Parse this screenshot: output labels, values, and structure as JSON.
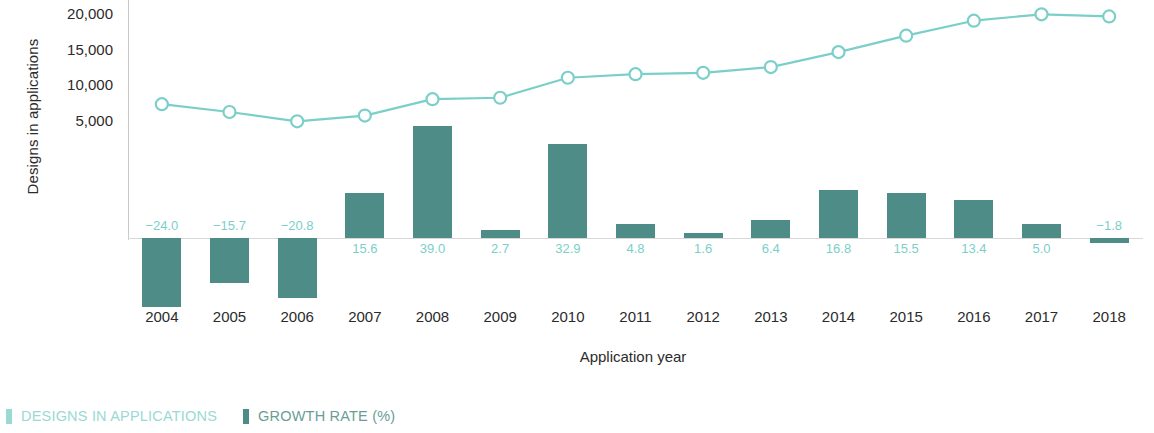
{
  "axes": {
    "y_title": "Designs in applications",
    "x_title": "Application year",
    "y_ticks": [
      "20,000",
      "15,000",
      "10,000",
      "5,000"
    ]
  },
  "legend": {
    "items": [
      {
        "label": "DESIGNS IN APPLICATIONS",
        "color": "#9ad9d4",
        "tone": "light"
      },
      {
        "label": "GROWTH RATE (%)",
        "color": "#4e8d87",
        "tone": "dark"
      }
    ]
  },
  "colors": {
    "bar": "#4e8d87",
    "line": "#7bcfc9",
    "bar_label": "#7bcfc9",
    "axis": "#c9c9c9",
    "text": "#2b2b2b",
    "background": "#ffffff"
  },
  "chart_data": {
    "type": "bar",
    "title": "",
    "xlabel": "Application year",
    "ylabel": "Designs in applications",
    "categories": [
      "2004",
      "2005",
      "2006",
      "2007",
      "2008",
      "2009",
      "2010",
      "2011",
      "2012",
      "2013",
      "2014",
      "2015",
      "2016",
      "2017",
      "2018"
    ],
    "ylim": [
      0,
      21500
    ],
    "grid": false,
    "legend_position": "bottom-left",
    "series": [
      {
        "name": "DESIGNS IN APPLICATIONS",
        "type": "line",
        "axis": "left",
        "color": "#7bcfc9",
        "marker": "open-circle",
        "values": [
          7500,
          6400,
          5100,
          5900,
          8200,
          8400,
          11200,
          11700,
          11900,
          12700,
          14800,
          17100,
          19200,
          20100,
          19800
        ]
      },
      {
        "name": "GROWTH RATE (%)",
        "type": "bar",
        "axis": "right",
        "color": "#4e8d87",
        "values": [
          -24.0,
          -15.7,
          -20.8,
          15.6,
          39.0,
          2.7,
          32.9,
          4.8,
          1.6,
          6.4,
          16.8,
          15.5,
          13.4,
          5.0,
          -1.8
        ],
        "labels": [
          "−24.0",
          "−15.7",
          "−20.8",
          "15.6",
          "39.0",
          "2.7",
          "32.9",
          "4.8",
          "1.6",
          "6.4",
          "16.8",
          "15.5",
          "13.4",
          "5.0",
          "−1.8"
        ]
      }
    ]
  }
}
